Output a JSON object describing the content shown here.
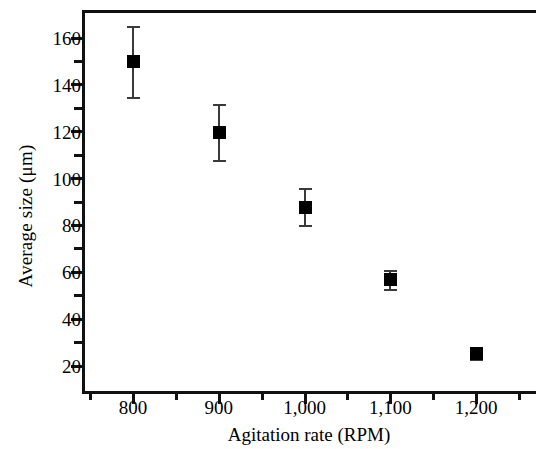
{
  "chart_data": {
    "type": "scatter",
    "title": "",
    "xlabel": "Agitation rate (RPM)",
    "ylabel": "Average size (μm)",
    "xlim": [
      740,
      1255
    ],
    "ylim": [
      9,
      169
    ],
    "grid": false,
    "legend": null,
    "x_ticks": [
      {
        "value": 800,
        "label": "800"
      },
      {
        "value": 900,
        "label": "900"
      },
      {
        "value": 1000,
        "label": "1,000"
      },
      {
        "value": 1100,
        "label": "1,100"
      },
      {
        "value": 1200,
        "label": "1,200"
      }
    ],
    "x_minor_ticks": [
      750,
      850,
      950,
      1050,
      1150,
      1250
    ],
    "y_ticks": [
      {
        "value": 160,
        "label": "160"
      },
      {
        "value": 140,
        "label": "140"
      },
      {
        "value": 120,
        "label": "120"
      },
      {
        "value": 100,
        "label": "100"
      },
      {
        "value": 80,
        "label": "80"
      },
      {
        "value": 60,
        "label": "60"
      },
      {
        "value": 40,
        "label": "40"
      },
      {
        "value": 20,
        "label": "20"
      }
    ],
    "y_minor_ticks": [
      150,
      130,
      110,
      90,
      70,
      50,
      30
    ],
    "series": [
      {
        "name": "Average particle size",
        "marker": "filled-square",
        "color": "#000000",
        "errorbar_color": "#3a3a3a",
        "x": [
          800,
          900,
          1000,
          1100,
          1200
        ],
        "values": [
          150,
          120,
          88,
          57,
          25.5
        ],
        "yerr": [
          15,
          12,
          8,
          4,
          2.5
        ]
      }
    ]
  }
}
